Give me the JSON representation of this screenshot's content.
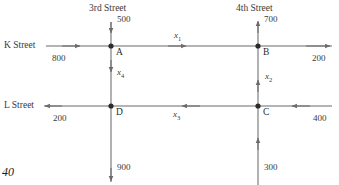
{
  "figure": {
    "page_number": "40",
    "type": "traffic-flow-network-diagram",
    "line_color": "#6b6b6b",
    "node_color": "#2b2b2b"
  },
  "streets": {
    "vertical": [
      {
        "name": "3rd Street",
        "x": 111
      },
      {
        "name": "4th Street",
        "x": 258
      }
    ],
    "horizontal": [
      {
        "name": "K Street",
        "y": 46
      },
      {
        "name": "L Street",
        "y": 106
      }
    ]
  },
  "nodes": [
    {
      "id": "A",
      "label": "A",
      "x": 111,
      "y": 46
    },
    {
      "id": "B",
      "label": "B",
      "x": 258,
      "y": 46
    },
    {
      "id": "C",
      "label": "C",
      "x": 258,
      "y": 106
    },
    {
      "id": "D",
      "label": "D",
      "x": 111,
      "y": 106
    }
  ],
  "boundary_flows": [
    {
      "id": "inflow-3rd-top",
      "value": "500",
      "direction": "down",
      "at": "3rd Street north of A"
    },
    {
      "id": "outflow-4th-top",
      "value": "700",
      "direction": "up",
      "at": "4th Street north of B"
    },
    {
      "id": "inflow-k-left",
      "value": "800",
      "direction": "right",
      "at": "K Street west of A"
    },
    {
      "id": "outflow-k-right",
      "value": "200",
      "direction": "right",
      "at": "K Street east of B"
    },
    {
      "id": "outflow-l-left",
      "value": "200",
      "direction": "left",
      "at": "L Street west of D"
    },
    {
      "id": "inflow-l-right",
      "value": "400",
      "direction": "left",
      "at": "L Street east of C"
    },
    {
      "id": "outflow-3rd-bottom",
      "value": "900",
      "direction": "down",
      "at": "3rd Street south of D"
    },
    {
      "id": "inflow-4th-bottom",
      "value": "300",
      "direction": "up",
      "at": "4th Street south of C"
    }
  ],
  "unknown_flows": [
    {
      "id": "x1",
      "label": "x",
      "sub": "1",
      "from": "A",
      "to": "B",
      "direction": "right"
    },
    {
      "id": "x2",
      "label": "x",
      "sub": "2",
      "from": "C",
      "to": "B",
      "direction": "up"
    },
    {
      "id": "x3",
      "label": "x",
      "sub": "3",
      "from": "C",
      "to": "D",
      "direction": "left"
    },
    {
      "id": "x4",
      "label": "x",
      "sub": "4",
      "from": "A",
      "to": "D",
      "direction": "down"
    }
  ]
}
